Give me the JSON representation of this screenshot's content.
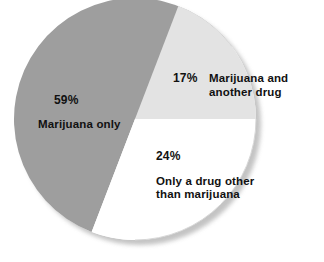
{
  "chart_data": {
    "type": "pie",
    "title": "",
    "subtitle": "",
    "xlabel": "",
    "ylabel": "",
    "legend_position": "on-slice",
    "grid": false,
    "categories": [
      "Marijuana only",
      "Marijuana and another drug",
      "Only a drug other than marijuana"
    ],
    "values": [
      59,
      17,
      24
    ],
    "value_labels": [
      "59%",
      "17%",
      "24%"
    ],
    "unit": "%",
    "slices": [
      {
        "label": "Marijuana only",
        "value": 59,
        "value_label": "59%",
        "color": "#9e9e9e",
        "start_angle_deg": 201,
        "end_angle_deg": 413
      },
      {
        "label": "Marijuana and another drug",
        "value": 17,
        "value_label": "17%",
        "color": "#e3e3e3",
        "start_angle_deg": 21,
        "end_angle_deg": 90
      },
      {
        "label": "Only a drug other than marijuana",
        "value": 24,
        "value_label": "24%",
        "color": "#ffffff",
        "start_angle_deg": 90,
        "end_angle_deg": 201
      }
    ],
    "colors": {
      "slice_marijuana_only": "#9e9e9e",
      "slice_marijuana_and_another_drug": "#e3e3e3",
      "slice_only_other_drug": "#ffffff",
      "outline": "#cfcfcf",
      "shadow": "#bdbdbd",
      "background": "#ffffff",
      "label_text": "#111111"
    }
  },
  "labels": {
    "marijuana_only": {
      "percent": "59%",
      "description": "Marijuana only"
    },
    "marijuana_and_another_drug": {
      "percent": "17%",
      "description": "Marijuana and another drug"
    },
    "only_other_drug": {
      "percent": "24%",
      "description": "Only a drug other than marijuana"
    }
  }
}
